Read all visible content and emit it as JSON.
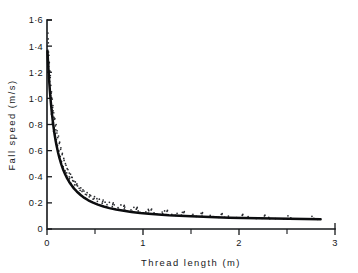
{
  "chart_data": {
    "type": "scatter",
    "title": "",
    "xlabel": "Thread  length  (m)",
    "ylabel": "Fall  speed  (m/s)",
    "xlim": [
      0,
      3
    ],
    "ylim": [
      0,
      1.6
    ],
    "grid": false,
    "legend": null,
    "x_ticks": [
      0,
      1,
      2,
      3
    ],
    "x_tick_labels": [
      "0",
      "1",
      "2",
      "3"
    ],
    "x_minor_ticks": [
      0.5,
      1.5,
      2.5
    ],
    "y_ticks": [
      0,
      0.2,
      0.4,
      0.6,
      0.8,
      1.0,
      1.2,
      1.4,
      1.6
    ],
    "y_tick_labels": [
      "0",
      "0·2",
      "0·4",
      "0·6",
      "0·8",
      "1·0",
      "1·2",
      "1·4",
      "1·6"
    ],
    "series": [
      {
        "name": "fitted curve",
        "type": "line",
        "points": [
          [
            0.005,
            1.36
          ],
          [
            0.01,
            1.29
          ],
          [
            0.015,
            1.225
          ],
          [
            0.02,
            1.165
          ],
          [
            0.025,
            1.11
          ],
          [
            0.03,
            1.06
          ],
          [
            0.035,
            1.013
          ],
          [
            0.04,
            0.97
          ],
          [
            0.05,
            0.893
          ],
          [
            0.06,
            0.827
          ],
          [
            0.07,
            0.77
          ],
          [
            0.08,
            0.72
          ],
          [
            0.09,
            0.676
          ],
          [
            0.1,
            0.637
          ],
          [
            0.115,
            0.586
          ],
          [
            0.13,
            0.542
          ],
          [
            0.15,
            0.493
          ],
          [
            0.17,
            0.452
          ],
          [
            0.19,
            0.417
          ],
          [
            0.21,
            0.388
          ],
          [
            0.23,
            0.362
          ],
          [
            0.25,
            0.34
          ],
          [
            0.28,
            0.311
          ],
          [
            0.31,
            0.287
          ],
          [
            0.35,
            0.26
          ],
          [
            0.39,
            0.238
          ],
          [
            0.43,
            0.22
          ],
          [
            0.48,
            0.202
          ],
          [
            0.53,
            0.187
          ],
          [
            0.59,
            0.172
          ],
          [
            0.65,
            0.16
          ],
          [
            0.72,
            0.149
          ],
          [
            0.8,
            0.139
          ],
          [
            0.88,
            0.131
          ],
          [
            0.97,
            0.123
          ],
          [
            1.06,
            0.117
          ],
          [
            1.16,
            0.111
          ],
          [
            1.27,
            0.105
          ],
          [
            1.38,
            0.101
          ],
          [
            1.5,
            0.097
          ],
          [
            1.63,
            0.093
          ],
          [
            1.76,
            0.09
          ],
          [
            1.9,
            0.087
          ],
          [
            2.05,
            0.084
          ],
          [
            2.2,
            0.082
          ],
          [
            2.36,
            0.08
          ],
          [
            2.52,
            0.078
          ],
          [
            2.68,
            0.076
          ],
          [
            2.85,
            0.075
          ]
        ]
      },
      {
        "name": "measurements",
        "type": "scatter",
        "points": [
          [
            0.01,
            1.5
          ],
          [
            0.012,
            1.455
          ],
          [
            0.014,
            1.425
          ],
          [
            0.008,
            1.37
          ],
          [
            0.016,
            1.355
          ],
          [
            0.02,
            1.33
          ],
          [
            0.011,
            1.3
          ],
          [
            0.024,
            1.275
          ],
          [
            0.018,
            1.245
          ],
          [
            0.03,
            1.21
          ],
          [
            0.022,
            1.19
          ],
          [
            0.034,
            1.16
          ],
          [
            0.028,
            1.13
          ],
          [
            0.04,
            1.1
          ],
          [
            0.033,
            1.075
          ],
          [
            0.047,
            1.05
          ],
          [
            0.038,
            1.02
          ],
          [
            0.055,
            0.995
          ],
          [
            0.044,
            0.965
          ],
          [
            0.062,
            0.945
          ],
          [
            0.051,
            0.915
          ],
          [
            0.07,
            0.89
          ],
          [
            0.058,
            0.862
          ],
          [
            0.082,
            0.845
          ],
          [
            0.066,
            0.815
          ],
          [
            0.095,
            0.8
          ],
          [
            0.075,
            0.775
          ],
          [
            0.105,
            0.752
          ],
          [
            0.086,
            0.728
          ],
          [
            0.12,
            0.712
          ],
          [
            0.098,
            0.685
          ],
          [
            0.132,
            0.665
          ],
          [
            0.11,
            0.64
          ],
          [
            0.145,
            0.622
          ],
          [
            0.124,
            0.598
          ],
          [
            0.16,
            0.58
          ],
          [
            0.138,
            0.556
          ],
          [
            0.175,
            0.54
          ],
          [
            0.152,
            0.516
          ],
          [
            0.192,
            0.5
          ],
          [
            0.168,
            0.478
          ],
          [
            0.21,
            0.462
          ],
          [
            0.185,
            0.44
          ],
          [
            0.232,
            0.428
          ],
          [
            0.205,
            0.408
          ],
          [
            0.255,
            0.396
          ],
          [
            0.228,
            0.378
          ],
          [
            0.28,
            0.366
          ],
          [
            0.25,
            0.35
          ],
          [
            0.305,
            0.338
          ],
          [
            0.275,
            0.322
          ],
          [
            0.335,
            0.312
          ],
          [
            0.3,
            0.298
          ],
          [
            0.365,
            0.288
          ],
          [
            0.33,
            0.276
          ],
          [
            0.4,
            0.266
          ],
          [
            0.36,
            0.255
          ],
          [
            0.44,
            0.246
          ],
          [
            0.395,
            0.236
          ],
          [
            0.48,
            0.228
          ],
          [
            0.43,
            0.22
          ],
          [
            0.525,
            0.212
          ],
          [
            0.47,
            0.205
          ],
          [
            0.575,
            0.198
          ],
          [
            0.515,
            0.192
          ],
          [
            0.625,
            0.186
          ],
          [
            0.565,
            0.18
          ],
          [
            0.68,
            0.174
          ],
          [
            0.62,
            0.169
          ],
          [
            0.74,
            0.164
          ],
          [
            0.68,
            0.159
          ],
          [
            0.805,
            0.154
          ],
          [
            0.745,
            0.15
          ],
          [
            0.875,
            0.146
          ],
          [
            0.815,
            0.142
          ],
          [
            0.95,
            0.138
          ],
          [
            0.89,
            0.135
          ],
          [
            1.03,
            0.131
          ],
          [
            0.97,
            0.128
          ],
          [
            1.115,
            0.124
          ],
          [
            1.055,
            0.121
          ],
          [
            1.205,
            0.118
          ],
          [
            1.145,
            0.115
          ],
          [
            1.3,
            0.112
          ],
          [
            1.24,
            0.11
          ],
          [
            1.4,
            0.107
          ],
          [
            1.34,
            0.105
          ],
          [
            1.505,
            0.102
          ],
          [
            1.445,
            0.1
          ],
          [
            1.615,
            0.098
          ],
          [
            1.555,
            0.096
          ],
          [
            1.73,
            0.094
          ],
          [
            1.67,
            0.092
          ],
          [
            1.85,
            0.09
          ],
          [
            1.79,
            0.089
          ],
          [
            1.975,
            0.087
          ],
          [
            1.915,
            0.086
          ],
          [
            2.105,
            0.084
          ],
          [
            2.045,
            0.083
          ],
          [
            2.24,
            0.082
          ],
          [
            2.18,
            0.081
          ],
          [
            2.38,
            0.08
          ],
          [
            2.32,
            0.079
          ],
          [
            2.525,
            0.078
          ],
          [
            2.465,
            0.077
          ],
          [
            2.675,
            0.076
          ],
          [
            2.615,
            0.075
          ],
          [
            2.82,
            0.074
          ],
          [
            0.035,
            1.175
          ],
          [
            0.048,
            1.005
          ],
          [
            0.064,
            0.905
          ],
          [
            0.078,
            0.84
          ],
          [
            0.092,
            0.76
          ],
          [
            0.112,
            0.7
          ],
          [
            0.142,
            0.61
          ],
          [
            0.178,
            0.525
          ],
          [
            0.218,
            0.455
          ],
          [
            0.262,
            0.395
          ],
          [
            0.312,
            0.345
          ],
          [
            0.375,
            0.3
          ],
          [
            0.445,
            0.262
          ],
          [
            0.52,
            0.232
          ],
          [
            0.605,
            0.205
          ],
          [
            0.7,
            0.185
          ],
          [
            0.81,
            0.168
          ],
          [
            0.93,
            0.152
          ],
          [
            1.06,
            0.14
          ],
          [
            1.2,
            0.13
          ],
          [
            1.355,
            0.12
          ],
          [
            1.52,
            0.112
          ],
          [
            1.7,
            0.105
          ],
          [
            1.89,
            0.099
          ],
          [
            2.095,
            0.094
          ],
          [
            2.31,
            0.089
          ],
          [
            2.54,
            0.085
          ],
          [
            2.78,
            0.081
          ],
          [
            0.019,
            1.265
          ],
          [
            0.027,
            1.205
          ],
          [
            0.043,
            1.04
          ],
          [
            0.059,
            0.93
          ],
          [
            0.073,
            0.855
          ],
          [
            0.088,
            0.79
          ],
          [
            0.103,
            0.735
          ],
          [
            0.128,
            0.655
          ],
          [
            0.158,
            0.57
          ],
          [
            0.198,
            0.488
          ],
          [
            0.245,
            0.42
          ],
          [
            0.295,
            0.36
          ],
          [
            0.352,
            0.315
          ],
          [
            0.418,
            0.278
          ],
          [
            0.495,
            0.248
          ],
          [
            0.585,
            0.222
          ],
          [
            0.69,
            0.2
          ],
          [
            0.805,
            0.182
          ],
          [
            0.94,
            0.166
          ],
          [
            1.09,
            0.153
          ],
          [
            1.255,
            0.142
          ],
          [
            1.43,
            0.133
          ],
          [
            1.62,
            0.125
          ],
          [
            1.825,
            0.118
          ],
          [
            2.04,
            0.112
          ],
          [
            2.27,
            0.106
          ],
          [
            2.51,
            0.101
          ],
          [
            2.76,
            0.097
          ],
          [
            0.046,
            0.88
          ],
          [
            0.056,
            0.81
          ],
          [
            0.068,
            0.748
          ],
          [
            0.084,
            0.695
          ],
          [
            0.099,
            0.648
          ],
          [
            0.118,
            0.592
          ],
          [
            0.148,
            0.518
          ],
          [
            0.188,
            0.448
          ],
          [
            0.235,
            0.388
          ],
          [
            0.288,
            0.338
          ],
          [
            0.345,
            0.296
          ],
          [
            0.412,
            0.262
          ],
          [
            0.49,
            0.234
          ],
          [
            0.58,
            0.21
          ],
          [
            0.685,
            0.19
          ],
          [
            0.8,
            0.174
          ],
          [
            0.935,
            0.158
          ],
          [
            1.085,
            0.146
          ],
          [
            1.25,
            0.135
          ],
          [
            1.425,
            0.126
          ],
          [
            1.615,
            0.118
          ],
          [
            1.82,
            0.111
          ],
          [
            2.035,
            0.105
          ],
          [
            2.265,
            0.1
          ],
          [
            0.205,
            0.43
          ],
          [
            0.232,
            0.4
          ],
          [
            0.268,
            0.37
          ],
          [
            0.318,
            0.33
          ],
          [
            0.385,
            0.29
          ],
          [
            0.455,
            0.255
          ],
          [
            0.545,
            0.228
          ],
          [
            0.65,
            0.204
          ],
          [
            0.77,
            0.184
          ],
          [
            0.905,
            0.166
          ],
          [
            1.055,
            0.15
          ],
          [
            1.225,
            0.138
          ],
          [
            1.41,
            0.128
          ],
          [
            1.605,
            0.12
          ],
          [
            1.815,
            0.113
          ],
          [
            2.035,
            0.107
          ]
        ]
      }
    ]
  }
}
